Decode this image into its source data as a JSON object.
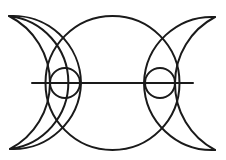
{
  "figure": {
    "stroke_color": "#1a1a1a",
    "background": "#ffffff",
    "stroke_width": 2
  },
  "geometry": {
    "large_circle": {
      "cx": 112.5,
      "cy": 83,
      "r": 67
    },
    "left_small_circle": {
      "cx": 65,
      "cy": 83,
      "r": 15
    },
    "right_small_circle": {
      "cx": 160,
      "cy": 83,
      "r": 15
    },
    "horizontal_line": {
      "x1": 32,
      "y1": 83,
      "x2": 193,
      "y2": 83
    },
    "left_crescent": {
      "top_tip": [
        9,
        16
      ],
      "bottom_tip": [
        10,
        149
      ],
      "outer_arc_r": 67,
      "inner_arc_r": 75
    },
    "right_crescent": {
      "top_tip": [
        215,
        17
      ],
      "bottom_tip": [
        215,
        150
      ],
      "outer_arc_r": 67,
      "inner_arc_r": 75
    }
  }
}
